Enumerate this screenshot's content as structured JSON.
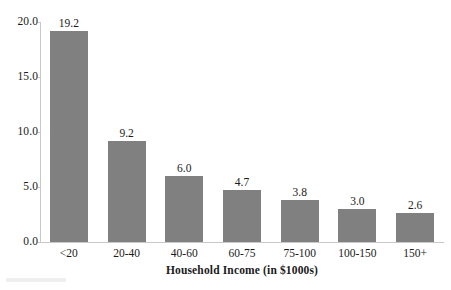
{
  "chart_data": {
    "type": "bar",
    "title": "",
    "subtitle": "",
    "xlabel": "Household Income (in $1000s)",
    "ylabel": "",
    "categories": [
      "<20",
      "20-40",
      "40-60",
      "60-75",
      "75-100",
      "100-150",
      "150+"
    ],
    "values": [
      19.2,
      9.2,
      6.0,
      4.7,
      3.8,
      3.0,
      2.6
    ],
    "value_labels": [
      "19.2",
      "9.2",
      "6.0",
      "4.7",
      "3.8",
      "3.0",
      "2.6"
    ],
    "ylim": [
      0.0,
      20.0
    ],
    "ytick_values": [
      0.0,
      5.0,
      10.0,
      15.0,
      20.0
    ],
    "ytick_labels": [
      "0.0",
      "5.0",
      "10.0",
      "15.0",
      "20.0"
    ],
    "grid": false,
    "legend": null,
    "legend_position": "none",
    "bar_color": "#808080",
    "background_color": "#ffffff",
    "axis_color": "#c8c8c8",
    "text_color": "#1a1a1a"
  }
}
